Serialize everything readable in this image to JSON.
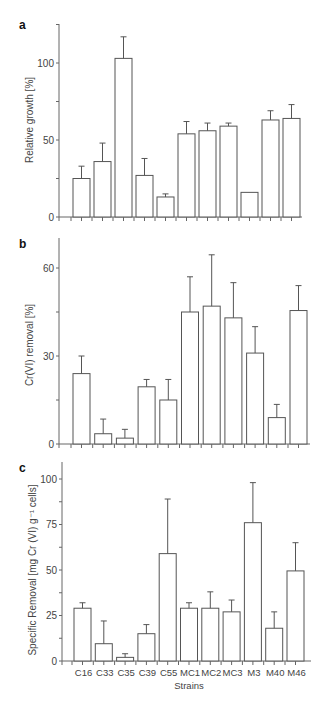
{
  "figure": {
    "strains_label": "Strains"
  },
  "chart_data": [
    {
      "panel": "a",
      "type": "bar",
      "title": "",
      "xlabel": "",
      "ylabel": "Relative growth [%]",
      "ylim": [
        0,
        125
      ],
      "yticks": [
        0,
        50,
        100
      ],
      "grid": false,
      "legend": null,
      "categories": [
        "C16",
        "C33",
        "C35",
        "C39",
        "C55",
        "MC1",
        "MC2",
        "MC3",
        "M3",
        "M40",
        "M46"
      ],
      "values": [
        25,
        36,
        103,
        27,
        13,
        54,
        56,
        59,
        16,
        63,
        64
      ],
      "error_upper": [
        33,
        48,
        117,
        38,
        15,
        62,
        61,
        61,
        null,
        69,
        73
      ],
      "show_xtick_labels": false
    },
    {
      "panel": "b",
      "type": "bar",
      "title": "",
      "xlabel": "",
      "ylabel": "Cr(VI) removal [%]",
      "ylim": [
        0,
        70
      ],
      "yticks": [
        0,
        30,
        60
      ],
      "grid": false,
      "legend": null,
      "categories": [
        "C16",
        "C33",
        "C35",
        "C39",
        "C55",
        "MC1",
        "MC2",
        "MC3",
        "M3",
        "M40",
        "M46"
      ],
      "values": [
        24,
        3.5,
        2,
        19.5,
        15,
        45,
        47,
        43,
        31,
        9,
        45.5
      ],
      "error_upper": [
        30,
        8.5,
        5,
        22,
        22,
        57,
        64.5,
        55,
        40,
        13.5,
        54
      ],
      "show_xtick_labels": false
    },
    {
      "panel": "c",
      "type": "bar",
      "title": "",
      "xlabel": "Strains",
      "ylabel": "Specific Removal [mg Cr (VI) g⁻¹ cells]",
      "ylim": [
        0,
        107
      ],
      "yticks": [
        0,
        25,
        50,
        75,
        100
      ],
      "grid": false,
      "legend": null,
      "categories": [
        "C16",
        "C33",
        "C35",
        "C39",
        "C55",
        "MC1",
        "MC2",
        "MC3",
        "M3",
        "M40",
        "M46"
      ],
      "values": [
        29,
        9.5,
        2,
        15,
        59,
        29,
        29,
        27,
        76,
        18,
        49.5
      ],
      "error_upper": [
        32,
        22,
        4,
        20,
        89,
        32,
        38,
        33.5,
        98,
        27,
        65
      ],
      "show_xtick_labels": true
    }
  ]
}
